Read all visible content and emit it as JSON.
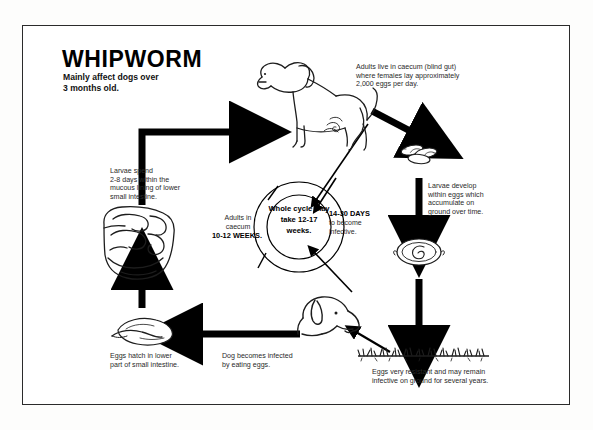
{
  "poster": {
    "title": "WHIPWORM",
    "subtitle": "Mainly affect dogs over\n3 months old."
  },
  "center": {
    "text": "Whole\ncycle may\ntake 12-17\nweeks."
  },
  "stages": {
    "adults_caecum": "Adults live in caecum (blind gut)\nwhere females lay approximately\n2,000 eggs per day.",
    "larvae_develop": "Larvae develop\nwithin eggs which\naccumulate on\nground over time.",
    "eggs_resistant": "Eggs very resistant and may remain\ninfective on ground for several years.",
    "larvae_spend": "Larvae spend\n2-8 days within the\nmucous lining of lower\nsmall intestine.",
    "eggs_hatch": "Eggs hatch in lower\npart of small intestine.",
    "dog_infected": "Dog becomes infected\nby eating eggs."
  },
  "timings": {
    "adults_in_caecum_label": "Adults in\ncaecum",
    "adults_weeks": "10-12 WEEKS.",
    "days_to_infective": "14-30 DAYS",
    "become_infective": "to become\ninfective."
  },
  "illustrations": {
    "adult_dog": "adult-dog-illustration",
    "egg_cluster": "egg-cluster-illustration",
    "larvated_egg": "larvated-egg-illustration",
    "ground_grass": "ground-grass-illustration",
    "dog_head_eating": "dog-head-eating-illustration",
    "hatching_egg": "hatching-egg-illustration",
    "intestine": "intestine-illustration"
  },
  "colors": {
    "ink": "#000000",
    "paper": "#ffffff",
    "caption": "#2a2a2a"
  }
}
